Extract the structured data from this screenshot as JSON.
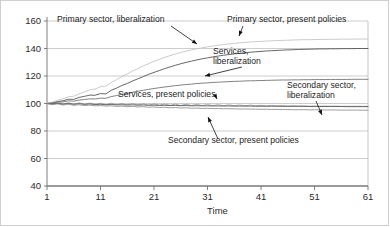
{
  "chart_data": {
    "type": "line",
    "title": "",
    "xlabel": "Time",
    "ylabel": "",
    "xlim": [
      1,
      61
    ],
    "ylim": [
      40,
      160
    ],
    "xticks": [
      1,
      11,
      21,
      31,
      41,
      51,
      61
    ],
    "yticks": [
      40,
      60,
      80,
      100,
      120,
      140,
      160
    ],
    "grid": true,
    "legend": "annotations-with-leader-lines",
    "x": [
      1,
      2,
      3,
      4,
      5,
      6,
      7,
      8,
      9,
      10,
      11,
      12,
      13,
      14,
      15,
      16,
      17,
      18,
      19,
      20,
      21,
      22,
      23,
      24,
      25,
      26,
      27,
      28,
      29,
      30,
      31,
      32,
      33,
      34,
      35,
      36,
      37,
      38,
      39,
      40,
      41,
      42,
      43,
      44,
      45,
      46,
      47,
      48,
      49,
      50,
      51,
      52,
      53,
      54,
      55,
      56,
      57,
      58,
      59,
      60,
      61
    ],
    "series": [
      {
        "name": "Primary sector, liberalization",
        "color": "#4a4a4a",
        "values": [
          100,
          100.6,
          101.4,
          102.0,
          103.1,
          103.0,
          104.4,
          105.2,
          106.1,
          106.0,
          107.2,
          107.0,
          109.6,
          111.2,
          113.1,
          114.6,
          116.4,
          118.0,
          119.6,
          121.2,
          122.6,
          124.0,
          125.4,
          126.6,
          127.8,
          128.9,
          129.9,
          130.8,
          131.7,
          132.5,
          133.2,
          133.9,
          134.5,
          135.1,
          135.6,
          136.1,
          136.5,
          136.9,
          137.3,
          137.6,
          137.9,
          138.2,
          138.4,
          138.6,
          138.8,
          139.0,
          139.1,
          139.3,
          139.4,
          139.5,
          139.6,
          139.7,
          139.7,
          139.8,
          139.8,
          139.9,
          139.9,
          139.9,
          140.0,
          140.0,
          140.0
        ]
      },
      {
        "name": "Primary sector, present policies",
        "color": "#c4c4c4",
        "values": [
          100,
          101.0,
          102.4,
          103.4,
          104.9,
          105.3,
          107.0,
          108.4,
          109.9,
          110.5,
          112.2,
          112.6,
          115.2,
          117.3,
          119.6,
          121.5,
          123.6,
          125.4,
          127.3,
          129.0,
          130.6,
          132.1,
          133.5,
          134.8,
          136.0,
          137.1,
          138.1,
          139.0,
          139.8,
          140.5,
          141.2,
          141.8,
          142.4,
          142.9,
          143.3,
          143.7,
          144.1,
          144.4,
          144.7,
          145.0,
          145.2,
          145.4,
          145.6,
          145.8,
          145.9,
          146.0,
          146.2,
          146.3,
          146.4,
          146.4,
          146.5,
          146.6,
          146.6,
          146.7,
          146.7,
          146.8,
          146.8,
          146.8,
          146.9,
          146.9,
          146.9
        ]
      },
      {
        "name": "Services, liberalization",
        "color": "#6b6b6b",
        "values": [
          100,
          100.3,
          100.9,
          101.2,
          101.9,
          101.7,
          102.5,
          102.9,
          103.4,
          103.3,
          103.9,
          103.8,
          105.0,
          105.8,
          106.7,
          107.4,
          108.2,
          108.9,
          109.6,
          110.3,
          110.9,
          111.5,
          112.0,
          112.5,
          113.0,
          113.4,
          113.8,
          114.1,
          114.5,
          114.8,
          115.0,
          115.3,
          115.5,
          115.7,
          115.9,
          116.1,
          116.2,
          116.4,
          116.5,
          116.6,
          116.7,
          116.8,
          116.9,
          117.0,
          117.1,
          117.1,
          117.2,
          117.2,
          117.3,
          117.3,
          117.4,
          117.4,
          117.4,
          117.5,
          117.5,
          117.5,
          117.5,
          117.6,
          117.6,
          117.6,
          117.6
        ]
      },
      {
        "name": "Services, present policies",
        "color": "#9a9a9a",
        "values": [
          100,
          99.4,
          100.4,
          99.3,
          100.6,
          99.2,
          100.5,
          99.3,
          100.3,
          99.2,
          100.1,
          99.0,
          100.2,
          99.1,
          100.0,
          99.0,
          99.9,
          98.9,
          99.8,
          98.8,
          99.7,
          98.8,
          99.6,
          98.7,
          99.5,
          98.6,
          99.4,
          98.6,
          99.3,
          98.5,
          99.2,
          98.5,
          99.1,
          98.4,
          99.0,
          98.4,
          98.9,
          98.3,
          98.8,
          98.3,
          98.7,
          98.2,
          98.6,
          98.2,
          98.5,
          98.1,
          98.4,
          98.1,
          98.3,
          98.0,
          98.2,
          98.0,
          98.1,
          98.0,
          98.1,
          97.9,
          98.0,
          97.9,
          98.0,
          97.9,
          97.9
        ]
      },
      {
        "name": "Secondary sector, liberalization",
        "color": "#555555",
        "values": [
          100,
          99.8,
          100.1,
          99.6,
          100.0,
          99.5,
          99.8,
          99.4,
          99.6,
          99.3,
          99.4,
          99.1,
          99.3,
          99.0,
          99.1,
          98.9,
          99.0,
          98.8,
          98.9,
          98.7,
          98.8,
          98.6,
          98.7,
          98.5,
          98.6,
          98.4,
          98.5,
          98.3,
          98.4,
          98.3,
          98.3,
          98.2,
          98.2,
          98.2,
          98.2,
          98.1,
          98.1,
          98.1,
          98.1,
          98.0,
          98.0,
          98.0,
          98.0,
          98.0,
          97.9,
          97.9,
          97.9,
          97.9,
          97.9,
          97.8,
          97.8,
          97.8,
          97.8,
          97.8,
          97.8,
          97.8,
          97.7,
          97.7,
          97.7,
          97.7,
          97.7
        ]
      },
      {
        "name": "Secondary sector, present policies",
        "color": "#8c8c8c",
        "values": [
          100,
          99.2,
          99.7,
          98.9,
          99.4,
          98.7,
          99.1,
          98.5,
          98.8,
          98.3,
          98.5,
          98.1,
          98.3,
          97.9,
          98.1,
          97.7,
          97.9,
          97.5,
          97.7,
          97.3,
          97.5,
          97.1,
          97.3,
          96.9,
          97.1,
          96.7,
          96.9,
          96.5,
          96.7,
          96.4,
          96.5,
          96.3,
          96.3,
          96.2,
          96.2,
          96.1,
          96.0,
          96.0,
          95.9,
          95.9,
          95.8,
          95.8,
          95.7,
          95.7,
          95.6,
          95.6,
          95.5,
          95.5,
          95.5,
          95.4,
          95.4,
          95.4,
          95.3,
          95.3,
          95.3,
          95.2,
          95.2,
          95.2,
          95.2,
          95.1,
          95.1
        ]
      }
    ],
    "annotations": [
      {
        "id": "ann-primary-lib",
        "text": "Primary sector, liberalization",
        "x": 57,
        "y": 22
      },
      {
        "id": "ann-primary-pres",
        "text": "Primary sector, present policies",
        "x": 227,
        "y": 22
      },
      {
        "id": "ann-services-lib-1",
        "text": "Services,",
        "x": 213,
        "y": 54
      },
      {
        "id": "ann-services-lib-2",
        "text": "liberalization",
        "x": 213,
        "y": 64
      },
      {
        "id": "ann-services-pres",
        "text": "Services, present policies",
        "x": 118,
        "y": 97
      },
      {
        "id": "ann-secondary-lib-1",
        "text": "Secondary sector,",
        "x": 287,
        "y": 88
      },
      {
        "id": "ann-secondary-lib-2",
        "text": "liberalization",
        "x": 287,
        "y": 98
      },
      {
        "id": "ann-secondary-pres",
        "text": "Secondary sector, present policies",
        "x": 168,
        "y": 143
      }
    ]
  }
}
